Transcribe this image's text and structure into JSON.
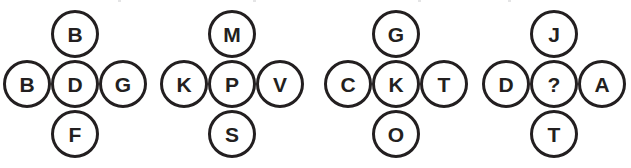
{
  "figure": {
    "type": "letter-circle-cluster-puzzle",
    "background_color": "#ffffff",
    "stroke_color": "#231f20",
    "text_color": "#231f20",
    "cluster_count": 4,
    "node_arrangement": [
      "top",
      "left",
      "center",
      "right",
      "bottom"
    ]
  },
  "clusters": [
    {
      "id": "cluster-1",
      "top": "B",
      "left": "B",
      "center": "D",
      "right": "G",
      "bottom": "F"
    },
    {
      "id": "cluster-2",
      "top": "M",
      "left": "K",
      "center": "P",
      "right": "V",
      "bottom": "S"
    },
    {
      "id": "cluster-3",
      "top": "G",
      "left": "C",
      "center": "K",
      "right": "T",
      "bottom": "O"
    },
    {
      "id": "cluster-4",
      "top": "J",
      "left": "D",
      "center": "?",
      "right": "A",
      "bottom": "T"
    }
  ]
}
